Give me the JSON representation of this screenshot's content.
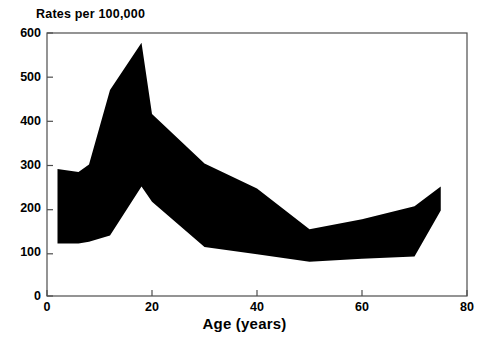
{
  "chart_data": {
    "type": "area",
    "title": "",
    "ylabel": "Rates per 100,000",
    "xlabel": "Age (years)",
    "xlim": [
      0,
      80
    ],
    "ylim": [
      0,
      600
    ],
    "xticks": [
      0,
      20,
      40,
      60,
      80
    ],
    "yticks": [
      0,
      100,
      200,
      300,
      400,
      500,
      600
    ],
    "grid": false,
    "legend": false,
    "fill_color": "#000000",
    "axis_color": "#4d4d4d",
    "background": "#ffffff",
    "x": [
      2,
      6,
      8,
      12,
      18,
      20,
      30,
      40,
      50,
      60,
      70,
      75
    ],
    "series": [
      {
        "name": "upper",
        "values": [
          290,
          283,
          300,
          470,
          578,
          415,
          302,
          245,
          152,
          175,
          205,
          250
        ]
      },
      {
        "name": "lower",
        "values": [
          120,
          120,
          124,
          138,
          250,
          215,
          112,
          95,
          78,
          85,
          90,
          195
        ]
      }
    ]
  },
  "axes": {
    "title_text": "Rates per 100,000",
    "xaxis_title": "Age (years)",
    "ytick_labels": [
      "600",
      "500",
      "400",
      "300",
      "200",
      "100",
      "0"
    ],
    "xtick_labels": [
      "0",
      "20",
      "40",
      "60",
      "80"
    ]
  }
}
